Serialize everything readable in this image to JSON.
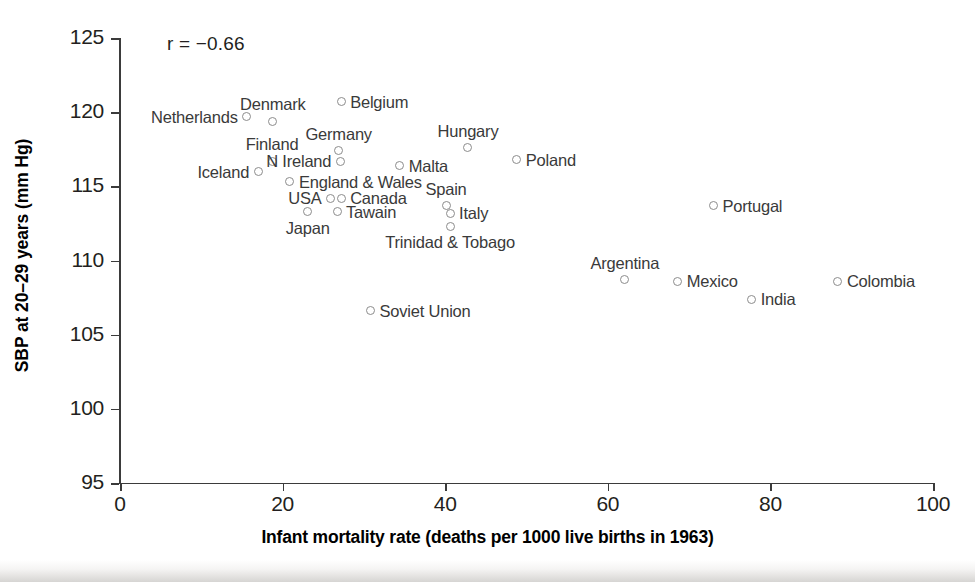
{
  "chart_data": {
    "type": "scatter",
    "title": "",
    "xlabel": "Infant mortality rate (deaths per 1000 live births in 1963)",
    "ylabel": "SBP at 20–29 years (mm Hg)",
    "xlim": [
      0,
      100
    ],
    "ylim": [
      95,
      125
    ],
    "xticks": [
      0,
      20,
      40,
      60,
      80,
      100
    ],
    "yticks": [
      95,
      100,
      105,
      110,
      115,
      120,
      125
    ],
    "grid": false,
    "legend": null,
    "annotation": "r = −0.66",
    "correlation": -0.66,
    "points": [
      {
        "label": "Netherlands",
        "x": 15.6,
        "y": 119.7,
        "label_pos": "left"
      },
      {
        "label": "Denmark",
        "x": 18.8,
        "y": 119.4,
        "label_pos": "above"
      },
      {
        "label": "Belgium",
        "x": 27.2,
        "y": 120.7,
        "label_pos": "right"
      },
      {
        "label": "Finland",
        "x": 18.7,
        "y": 116.7,
        "label_pos": "above"
      },
      {
        "label": "Iceland",
        "x": 17.0,
        "y": 116.0,
        "label_pos": "left"
      },
      {
        "label": "Germany",
        "x": 26.9,
        "y": 117.4,
        "label_pos": "above"
      },
      {
        "label": "N Ireland",
        "x": 27.1,
        "y": 116.7,
        "label_pos": "left"
      },
      {
        "label": "England & Wales",
        "x": 20.9,
        "y": 115.3,
        "label_pos": "right"
      },
      {
        "label": "USA",
        "x": 25.9,
        "y": 114.2,
        "label_pos": "left"
      },
      {
        "label": "Canada",
        "x": 27.2,
        "y": 114.2,
        "label_pos": "right"
      },
      {
        "label": "Japan",
        "x": 23.1,
        "y": 113.3,
        "label_pos": "below"
      },
      {
        "label": "Tawain",
        "x": 26.7,
        "y": 113.3,
        "label_pos": "right"
      },
      {
        "label": "Malta",
        "x": 34.4,
        "y": 116.4,
        "label_pos": "right"
      },
      {
        "label": "Hungary",
        "x": 42.8,
        "y": 117.6,
        "label_pos": "above"
      },
      {
        "label": "Poland",
        "x": 48.8,
        "y": 116.8,
        "label_pos": "right"
      },
      {
        "label": "Spain",
        "x": 40.1,
        "y": 113.7,
        "label_pos": "above"
      },
      {
        "label": "Italy",
        "x": 40.6,
        "y": 113.2,
        "label_pos": "right"
      },
      {
        "label": "Trinidad & Tobago",
        "x": 40.6,
        "y": 112.3,
        "label_pos": "below"
      },
      {
        "label": "Soviet Union",
        "x": 30.8,
        "y": 106.6,
        "label_pos": "right"
      },
      {
        "label": "Portugal",
        "x": 73.0,
        "y": 113.7,
        "label_pos": "right"
      },
      {
        "label": "Argentina",
        "x": 62.1,
        "y": 108.7,
        "label_pos": "above"
      },
      {
        "label": "Mexico",
        "x": 68.6,
        "y": 108.6,
        "label_pos": "right"
      },
      {
        "label": "India",
        "x": 77.7,
        "y": 107.4,
        "label_pos": "right"
      },
      {
        "label": "Colombia",
        "x": 88.3,
        "y": 108.6,
        "label_pos": "right"
      }
    ]
  },
  "axes": {
    "y_title": "SBP at 20–29 years (mm Hg)",
    "x_title": "Infant mortality rate (deaths per 1000 live births in 1963)",
    "x_tick_labels": [
      "0",
      "20",
      "40",
      "60",
      "80",
      "100"
    ],
    "y_tick_labels": [
      "95",
      "100",
      "105",
      "110",
      "115",
      "120",
      "125"
    ]
  },
  "annotation": {
    "text": "r = −0.66"
  },
  "colors": {
    "axis": "#3b3b3b",
    "marker_stroke": "#8c8c8c",
    "label_text": "#3a3a3a",
    "title_text": "#000000",
    "background": "#ffffff"
  }
}
